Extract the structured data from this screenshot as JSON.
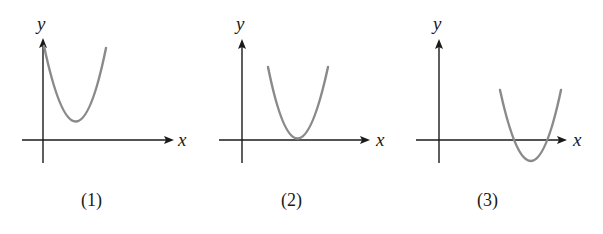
{
  "figures": [
    {
      "id": 1,
      "caption": "(1)",
      "x_label": "x",
      "y_label": "y",
      "description": "Upward parabola entirely above x-axis, vertex in first quadrant, left arm starting on y-axis",
      "curve_color": "#8a8a8a"
    },
    {
      "id": 2,
      "caption": "(2)",
      "x_label": "x",
      "y_label": "y",
      "description": "Upward parabola tangent to x-axis at positive x (vertex on x-axis)",
      "curve_color": "#8a8a8a"
    },
    {
      "id": 3,
      "caption": "(3)",
      "x_label": "x",
      "y_label": "y",
      "description": "Upward parabola crossing x-axis at two positive x values, vertex below x-axis",
      "curve_color": "#8a8a8a"
    }
  ]
}
